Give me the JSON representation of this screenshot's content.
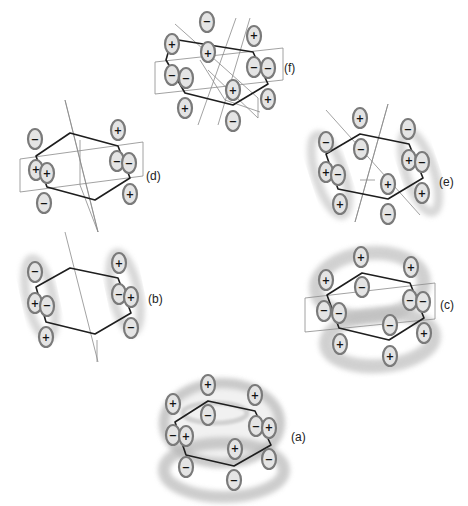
{
  "figure": {
    "panels": [
      {
        "id": "f",
        "label": "(f)",
        "label_pos": [
          287,
          68
        ],
        "hexagon": [
          [
            172,
            39
          ],
          [
            253,
            52
          ],
          [
            276,
            85
          ],
          [
            234,
            107
          ],
          [
            185,
            93
          ],
          [
            166,
            61
          ]
        ],
        "planes": [
          [
            [
              172,
              19
            ],
            [
              258,
              100
            ],
            [
              258,
              118
            ],
            [
              172,
              37
            ]
          ],
          [
            [
              157,
              60
            ],
            [
              282,
              48
            ],
            [
              282,
              78
            ],
            [
              157,
              92
            ]
          ],
          [
            [
              210,
              128
            ],
            [
              232,
              18
            ],
            [
              248,
              18
            ],
            [
              226,
              128
            ]
          ]
        ],
        "lobes": [
          {
            "x": 172,
            "y": 19,
            "s": "−"
          },
          {
            "x": 174,
            "y": 53,
            "s": "+"
          },
          {
            "x": 172,
            "y": 45,
            "s": "+",
            "hide": true
          },
          {
            "x": 175,
            "y": 45,
            "s": "+"
          },
          {
            "x": 254,
            "y": 35,
            "s": "+"
          },
          {
            "x": 253,
            "y": 68,
            "s": "−"
          },
          {
            "x": 264,
            "y": 67,
            "s": "−"
          },
          {
            "x": 277,
            "y": 100,
            "s": "+"
          },
          {
            "x": 233,
            "y": 90,
            "s": "+"
          },
          {
            "x": 233,
            "y": 122,
            "s": "−"
          },
          {
            "x": 184,
            "y": 107,
            "s": "+"
          },
          {
            "x": 186,
            "y": 78,
            "s": "−"
          },
          {
            "x": 167,
            "y": 78,
            "s": "−"
          },
          {
            "x": 173,
            "y": 45,
            "s": "+"
          }
        ]
      },
      {
        "id": "d",
        "label": "(d)",
        "label_pos": [
          146,
          175
        ]
      },
      {
        "id": "e",
        "label": "(e)",
        "label_pos": [
          440,
          182
        ]
      },
      {
        "id": "b",
        "label": "(b)",
        "label_pos": [
          149,
          299
        ]
      },
      {
        "id": "c",
        "label": "(c)",
        "label_pos": [
          441,
          305
        ]
      },
      {
        "id": "a",
        "label": "(a)",
        "label_pos": [
          290,
          438
        ]
      }
    ]
  },
  "labels": {
    "a": "(a)",
    "b": "(b)",
    "c": "(c)",
    "d": "(d)",
    "e": "(e)",
    "f": "(f)"
  },
  "signs": {
    "plus": "+",
    "minus": "−"
  },
  "colors": {
    "bond": "#1e1e1e",
    "plane": "#8a8a8a",
    "lobe_fill": "#e4e4e4",
    "lobe_stroke": "#7a7a7a",
    "cloud": "#c8c8c8"
  }
}
